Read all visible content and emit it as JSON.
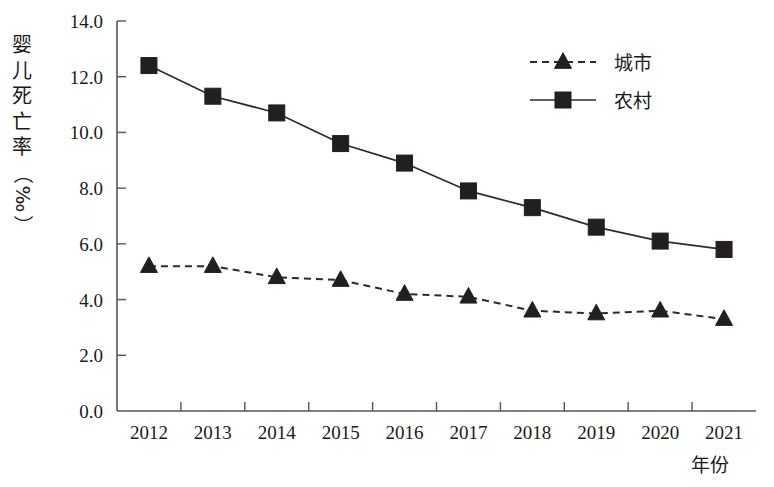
{
  "chart_data": {
    "type": "line",
    "title": "",
    "xlabel": "年份",
    "ylabel": "婴儿死亡率（‰）",
    "categories": [
      "2012",
      "2013",
      "2014",
      "2015",
      "2016",
      "2017",
      "2018",
      "2019",
      "2020",
      "2021"
    ],
    "series": [
      {
        "name": "城市",
        "marker": "triangle",
        "linestyle": "dashed",
        "color": "#231f20",
        "values": [
          5.2,
          5.2,
          4.8,
          4.7,
          4.2,
          4.1,
          3.6,
          3.5,
          3.6,
          3.3
        ]
      },
      {
        "name": "农村",
        "marker": "square",
        "linestyle": "solid",
        "color": "#231f20",
        "values": [
          12.4,
          11.3,
          10.7,
          9.6,
          8.9,
          7.9,
          7.3,
          6.6,
          6.1,
          5.8
        ]
      }
    ],
    "ylim": [
      0.0,
      14.0
    ],
    "ytick_labels": [
      "0.0",
      "2.0",
      "4.0",
      "6.0",
      "8.0",
      "10.0",
      "12.0",
      "14.0"
    ],
    "ytick_values": [
      0.0,
      2.0,
      4.0,
      6.0,
      8.0,
      10.0,
      12.0,
      14.0
    ],
    "grid": false,
    "legend_position": "top-right"
  },
  "legend": {
    "entries": [
      {
        "label": "城市"
      },
      {
        "label": "农村"
      }
    ]
  },
  "axes": {
    "y_axis_title": "婴儿死亡率（‰）",
    "x_axis_title": "年份"
  }
}
